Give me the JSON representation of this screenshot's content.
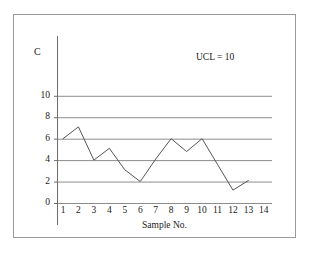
{
  "chart_data": {
    "type": "line",
    "title": "",
    "xlabel": "Sample No.",
    "ylabel": "C",
    "x": [
      1,
      2,
      3,
      4,
      5,
      6,
      7,
      8,
      9,
      10,
      11,
      12,
      13
    ],
    "values": [
      6.0,
      7.1,
      4.0,
      5.1,
      3.1,
      2.0,
      4.1,
      6.0,
      4.8,
      6.0,
      3.6,
      1.2,
      2.1
    ],
    "series": [
      {
        "name": "C",
        "values": [
          6.0,
          7.1,
          4.0,
          5.1,
          3.1,
          2.0,
          4.1,
          6.0,
          4.8,
          6.0,
          3.6,
          1.2,
          2.1
        ]
      }
    ],
    "xticks": [
      "1",
      "2",
      "3",
      "4",
      "5",
      "6",
      "7",
      "8",
      "9",
      "10",
      "11",
      "12",
      "13",
      "14"
    ],
    "yticks": [
      "0",
      "2",
      "4",
      "6",
      "8",
      "10"
    ],
    "ytick_values": [
      0,
      2,
      4,
      6,
      8,
      10
    ],
    "xlim": [
      1,
      14
    ],
    "ylim": [
      0,
      10
    ],
    "grid": "horizontal",
    "legend": "none",
    "annotations": [
      {
        "text": "UCL = 10",
        "x": 9.5,
        "y": 10.8
      }
    ],
    "line_color": "#555555",
    "grid_color": "#8c8c8c",
    "axis_color": "#6e6e6e",
    "frame_color": "#9a9a9a",
    "background_color": "#ffffff"
  }
}
